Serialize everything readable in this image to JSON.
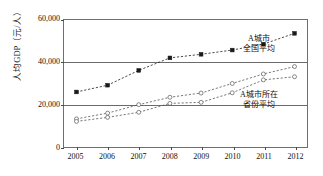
{
  "chart_data": {
    "type": "line",
    "title": "",
    "xlabel": "",
    "ylabel": "人均GDP（元/人）",
    "x": [
      2005,
      2006,
      2007,
      2008,
      2009,
      2010,
      2011,
      2012
    ],
    "categories": [
      "2005",
      "2006",
      "2007",
      "2008",
      "2009",
      "2010",
      "2011",
      "2012"
    ],
    "ylim": [
      0,
      60000
    ],
    "xlim": [
      2004.6,
      2012.4
    ],
    "yticks": [
      0,
      20000,
      40000,
      60000
    ],
    "ytick_labels": [
      "0",
      "20,000",
      "40,000",
      "60,000"
    ],
    "grid": "horizontal",
    "legend_position": "inline-annotation",
    "series": [
      {
        "name": "A城市",
        "marker": "filled-square",
        "linestyle": "dashed",
        "color": "#1a1a1a",
        "values": [
          26000,
          29200,
          36200,
          42100,
          43800,
          45800,
          48600,
          53700
        ]
      },
      {
        "name": "全国平均",
        "marker": "open-circle",
        "linestyle": "dashed",
        "color": "#555555",
        "values": [
          13300,
          16000,
          20000,
          23500,
          25500,
          30000,
          34500,
          38000
        ]
      },
      {
        "name": "A城市所在省份平均",
        "marker": "open-circle",
        "linestyle": "dashed",
        "color": "#555555",
        "values": [
          12100,
          14000,
          16400,
          20600,
          21100,
          25600,
          31700,
          33200
        ]
      }
    ],
    "annotations": [
      {
        "id": "city-national",
        "line1": "A城市",
        "line2": "全国平均"
      },
      {
        "id": "province-avg",
        "line1": "A城市所在",
        "line2": "省份平均"
      }
    ]
  }
}
